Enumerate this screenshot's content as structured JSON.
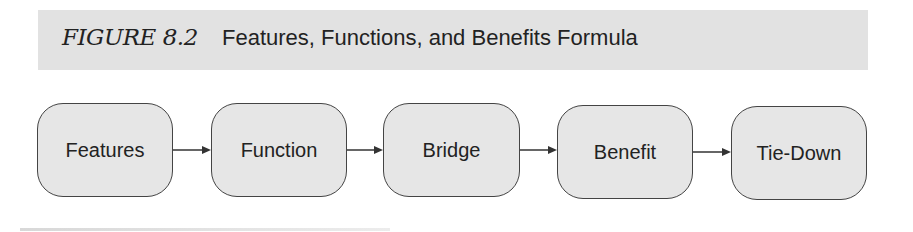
{
  "figure": {
    "label": "FIGURE 8.2",
    "title": "Features, Functions, and Benefits Formula"
  },
  "flow": {
    "nodes": [
      {
        "label": "Features"
      },
      {
        "label": "Function"
      },
      {
        "label": "Bridge"
      },
      {
        "label": "Benefit"
      },
      {
        "label": "Tie-Down"
      }
    ],
    "connector": "arrow-right"
  },
  "colors": {
    "header_band": "#e2e2e2",
    "node_fill": "#e6e6e6",
    "node_border": "#444444",
    "text": "#222222"
  }
}
